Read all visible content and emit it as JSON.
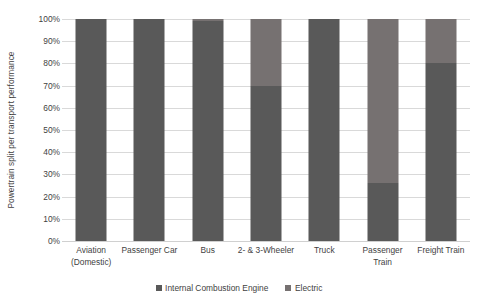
{
  "chart_data": {
    "type": "bar",
    "subtype": "100% stacked column",
    "title": "",
    "xlabel": "",
    "ylabel": "Powertrain split per transport performance",
    "ylim": [
      0,
      100
    ],
    "ytick_labels": [
      "100%",
      "90%",
      "80%",
      "70%",
      "60%",
      "50%",
      "40%",
      "30%",
      "20%",
      "10%",
      "0%"
    ],
    "ytick_values": [
      100,
      90,
      80,
      70,
      60,
      50,
      40,
      30,
      20,
      10,
      0
    ],
    "grid": true,
    "legend_position": "bottom",
    "categories": [
      "Aviation (Domestic)",
      "Passenger Car",
      "Bus",
      "2- & 3-Wheeler",
      "Truck",
      "Passenger Train",
      "Freight Train"
    ],
    "category_lines": [
      [
        "Aviation",
        "(Domestic)"
      ],
      [
        "Passenger Car"
      ],
      [
        "Bus"
      ],
      [
        "2- & 3-Wheeler"
      ],
      [
        "Truck"
      ],
      [
        "Passenger",
        "Train"
      ],
      [
        "Freight Train"
      ]
    ],
    "series": [
      {
        "name": "Internal Combustion Engine",
        "color": "#595959",
        "values": [
          100,
          100,
          99,
          70,
          100,
          26,
          80
        ]
      },
      {
        "name": "Electric",
        "color": "#767171",
        "values": [
          0,
          0,
          1,
          30,
          0,
          74,
          20
        ]
      }
    ]
  },
  "legend": {
    "items": [
      {
        "label": "Internal Combustion Engine",
        "color": "#595959"
      },
      {
        "label": "Electric",
        "color": "#767171"
      }
    ]
  },
  "axis": {
    "y_title": "Powertrain split per transport performance"
  }
}
